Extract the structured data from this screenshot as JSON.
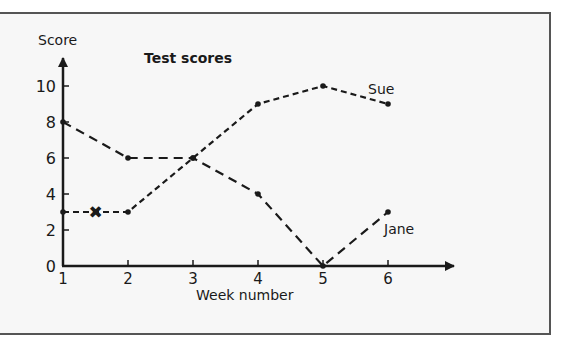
{
  "chart_data": {
    "type": "line",
    "title": "Test scores",
    "xlabel": "Week number",
    "ylabel": "Score",
    "x": [
      1,
      2,
      3,
      4,
      5,
      6
    ],
    "x_tick_labels": [
      "1",
      "2",
      "3",
      "4",
      "5",
      "6"
    ],
    "y_tick_labels": [
      "0",
      "2",
      "4",
      "6",
      "8",
      "10"
    ],
    "y_ticks": [
      0,
      2,
      4,
      6,
      8,
      10
    ],
    "xlim": [
      1,
      6
    ],
    "ylim": [
      0,
      10
    ],
    "grid": false,
    "legend": "inline labels at line ends",
    "series": [
      {
        "name": "Sue",
        "values": [
          3,
          3,
          6,
          9,
          10,
          9
        ],
        "style": "dashed-short"
      },
      {
        "name": "Jane",
        "values": [
          8,
          6,
          6,
          4,
          0,
          3
        ],
        "style": "dashed-long"
      }
    ],
    "annotations": [
      {
        "type": "cross-marker",
        "x": 1.5,
        "y": 3,
        "glyph": "✖"
      }
    ]
  },
  "labels": {
    "title": "Test scores",
    "ylabel": "Score",
    "xlabel": "Week number",
    "sue": "Sue",
    "jane": "Jane"
  },
  "colors": {
    "background": "#f7f7f7",
    "ink": "#1a1a1a",
    "frame": "#555555"
  }
}
